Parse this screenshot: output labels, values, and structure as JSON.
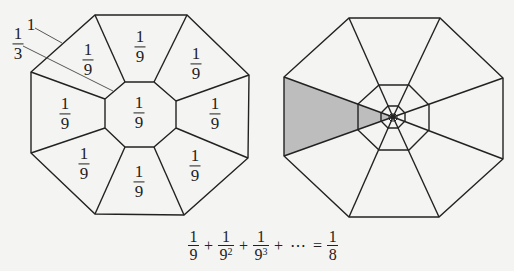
{
  "figure": {
    "left": {
      "title": "Octagon subdivided into ninths",
      "center_label": {
        "num": "1",
        "den": "9"
      },
      "region_labels": [
        {
          "num": "1",
          "den": "9"
        },
        {
          "num": "1",
          "den": "9"
        },
        {
          "num": "1",
          "den": "9"
        },
        {
          "num": "1",
          "den": "9"
        },
        {
          "num": "1",
          "den": "9"
        },
        {
          "num": "1",
          "den": "9"
        },
        {
          "num": "1",
          "den": "9"
        },
        {
          "num": "1",
          "den": "9"
        }
      ],
      "side_label": "1",
      "inner_side_label": {
        "num": "1",
        "den": "3"
      }
    },
    "right": {
      "title": "Nested octagons with shaded ninths",
      "shade_color": "#bdbdbd",
      "line_color": "#222222"
    },
    "formula": {
      "terms": [
        {
          "num": "1",
          "den": "9",
          "exp": ""
        },
        {
          "num": "1",
          "den": "9",
          "exp": "2"
        },
        {
          "num": "1",
          "den": "9",
          "exp": "3"
        }
      ],
      "plus": "+",
      "ellipsis": "⋯",
      "equals": "=",
      "result": {
        "num": "1",
        "den": "8"
      }
    }
  }
}
